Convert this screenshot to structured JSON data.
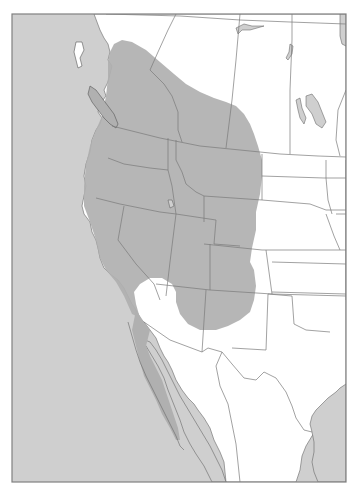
{
  "map": {
    "type": "species-range-map",
    "region": "Western North America",
    "colors": {
      "ocean": "#cfcfcf",
      "land": "#ffffff",
      "range": "#b0b0b0",
      "borders": "#7a7a7a",
      "frame": "#808080"
    },
    "legend": null,
    "labels": []
  }
}
